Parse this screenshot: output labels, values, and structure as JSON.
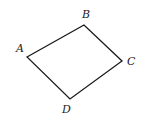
{
  "diagram": {
    "type": "quadrilateral",
    "colors": {
      "stroke": "#1a1a1a",
      "label": "#222222",
      "background": "#ffffff"
    },
    "vertices": [
      {
        "name": "A",
        "x": 27,
        "y": 57,
        "label_x": 16,
        "label_y": 52
      },
      {
        "name": "B",
        "x": 84,
        "y": 25,
        "label_x": 82,
        "label_y": 18
      },
      {
        "name": "C",
        "x": 122,
        "y": 61,
        "label_x": 127,
        "label_y": 65
      },
      {
        "name": "D",
        "x": 70,
        "y": 99,
        "label_x": 62,
        "label_y": 113
      }
    ],
    "edges": [
      [
        "A",
        "B"
      ],
      [
        "B",
        "C"
      ],
      [
        "C",
        "D"
      ],
      [
        "D",
        "A"
      ]
    ]
  }
}
